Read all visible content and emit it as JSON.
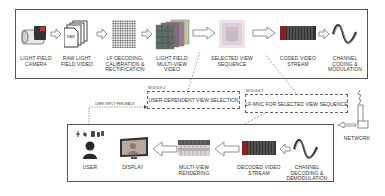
{
  "top_pipeline": {
    "stages": [
      {
        "id": "camera",
        "icon": "camera-icon",
        "label_lines": [
          "Light Field",
          "Camera"
        ]
      },
      {
        "id": "raw",
        "icon": "raw-files-icon",
        "label_lines": [
          "Raw Light",
          "Field Video"
        ],
        "file_tag": "RAW"
      },
      {
        "id": "decode",
        "icon": "lenslet-grid-icon",
        "label_lines": [
          "LF Decoding,",
          "Calibration &",
          "Rectification"
        ]
      },
      {
        "id": "multiview",
        "icon": "multiview-stack-icon",
        "label_lines": [
          "Light Field",
          "Multi-view",
          "Video"
        ]
      },
      {
        "id": "selected",
        "icon": "selected-view-icon",
        "label_lines": [
          "Selected View",
          "Sequence"
        ]
      },
      {
        "id": "coded",
        "icon": "bitstream-icon",
        "label_lines": [
          "Coded Video",
          "Stream"
        ]
      },
      {
        "id": "channel_tx",
        "icon": "waveform-icon",
        "label_lines": [
          "Channel",
          "Coding &",
          "Modulation"
        ]
      }
    ]
  },
  "modules": [
    {
      "id": "module1",
      "tag": "Module 1",
      "title": "User-dependent View Selection"
    },
    {
      "id": "module2",
      "tag": "Module 2",
      "title": "LF-MVC for Selected View Sequence"
    }
  ],
  "feedback_label": "User input feedback",
  "network_label": "Network",
  "bottom_pipeline": {
    "stages": [
      {
        "id": "user",
        "icon": "user-icon",
        "label_lines": [
          "User"
        ]
      },
      {
        "id": "display",
        "icon": "monitor-icon",
        "label_lines": [
          "Display"
        ]
      },
      {
        "id": "render",
        "icon": "multiview-render-icon",
        "label_lines": [
          "Multi-view",
          "Rendering"
        ]
      },
      {
        "id": "decoded",
        "icon": "bitstream-icon",
        "label_lines": [
          "Decoded Video",
          "Stream"
        ]
      },
      {
        "id": "channel_rx",
        "icon": "waveform-icon",
        "label_lines": [
          "Channel",
          "Decoding &",
          "Demodulation"
        ]
      }
    ]
  },
  "colors": {
    "frame": "#555555",
    "arrow_fill": "#ffffff",
    "arrow_stroke": "#777777",
    "dash": "#666666"
  }
}
